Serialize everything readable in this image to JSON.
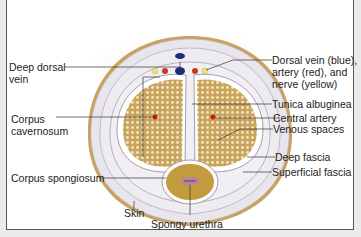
{
  "diagram": {
    "labels": {
      "deep_dorsal_vein": [
        "Deep dorsal",
        "vein"
      ],
      "corpus_cavernosum": [
        "Corpus",
        "cavernosum"
      ],
      "corpus_spongiosum": "Corpus spongiosum",
      "skin": "Skin",
      "spongy_urethra": "Spongy urethra",
      "dorsal_vessels": [
        "Dorsal vein (blue),",
        "artery (red), and",
        "nerve (yellow)"
      ],
      "tunica_albuginea": "Tunica albuginea",
      "central_artery": "Central artery",
      "venous_spaces": "Venous spaces",
      "deep_fascia": "Deep fascia",
      "superficial_fascia": "Superficial fascia"
    },
    "colors": {
      "skin": "#c9a160",
      "fascia": "#e6e4ea",
      "tissue": "#d8b66e",
      "vein": "#1f2a78",
      "artery": "#c83a22",
      "nerve": "#efe08a",
      "urethra": "#b583a6"
    }
  }
}
